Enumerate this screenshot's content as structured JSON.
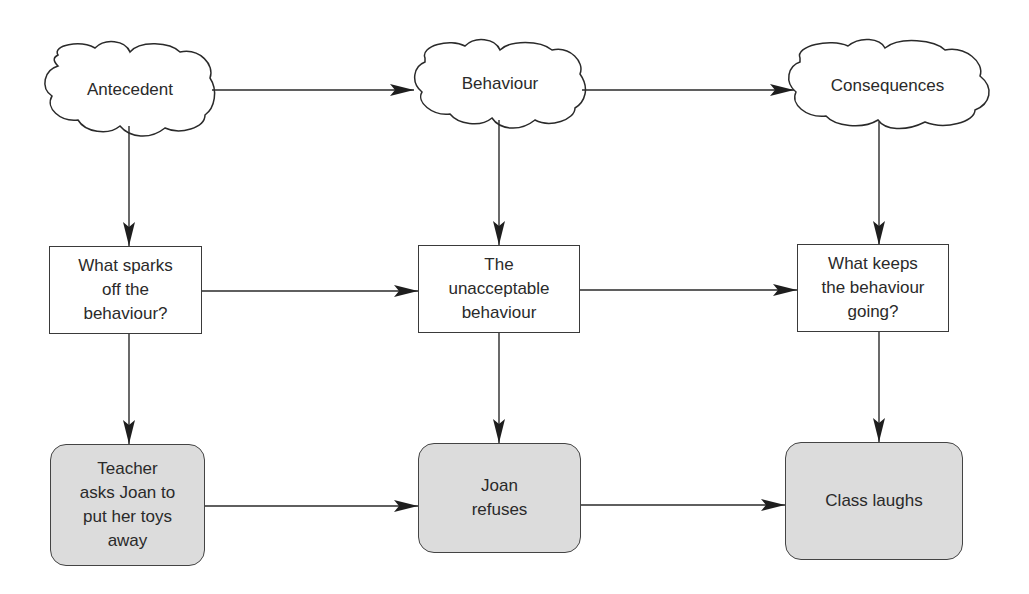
{
  "colors": {
    "line": "#2a2a2a",
    "box_fill_plain": "#ffffff",
    "box_fill_example": "#dcdcdc"
  },
  "header_clouds": [
    {
      "id": "antecedent",
      "label": "Antecedent"
    },
    {
      "id": "behaviour",
      "label": "Behaviour"
    },
    {
      "id": "consequences",
      "label": "Consequences"
    }
  ],
  "question_boxes": [
    {
      "id": "antecedent-question",
      "label": "What sparks\noff the\nbehaviour?"
    },
    {
      "id": "behaviour-question",
      "label": "The\nunacceptable\nbehaviour"
    },
    {
      "id": "consequences-question",
      "label": "What keeps\nthe behaviour\ngoing?"
    }
  ],
  "example_boxes": [
    {
      "id": "antecedent-example",
      "label": "Teacher\nasks Joan to\nput her toys\naway"
    },
    {
      "id": "behaviour-example",
      "label": "Joan\nrefuses"
    },
    {
      "id": "consequences-example",
      "label": "Class laughs"
    }
  ]
}
